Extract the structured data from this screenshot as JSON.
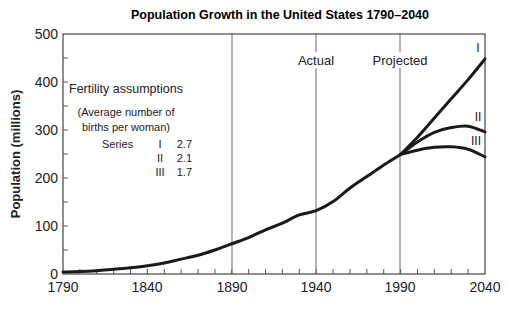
{
  "chart_data": {
    "type": "line",
    "title": "Population Growth in the United States 1790–2040",
    "xlabel": "",
    "ylabel": "Population (millions)",
    "xlim": [
      1790,
      2040
    ],
    "ylim": [
      0,
      500
    ],
    "x_ticks": [
      "1790",
      "1840",
      "1890",
      "1940",
      "1990",
      "2040"
    ],
    "y_ticks": [
      "0",
      "100",
      "200",
      "300",
      "400",
      "500"
    ],
    "grid": "vertical lines at 1890, 1940, 1990",
    "annotations": [
      "Actual",
      "Projected"
    ],
    "legend": {
      "title": "Fertility assumptions",
      "subtitle_line1": "(Average number of",
      "subtitle_line2": "births per woman)",
      "header": "Series",
      "rows": [
        {
          "series": "I",
          "value": "2.7"
        },
        {
          "series": "II",
          "value": "2.1"
        },
        {
          "series": "III",
          "value": "1.7"
        }
      ]
    },
    "series": [
      {
        "name": "Actual",
        "x": [
          1790,
          1800,
          1810,
          1820,
          1830,
          1840,
          1850,
          1860,
          1870,
          1880,
          1890,
          1900,
          1910,
          1920,
          1930,
          1940,
          1950,
          1960,
          1970,
          1980,
          1990
        ],
        "values": [
          4,
          5,
          7,
          10,
          13,
          17,
          23,
          31,
          39,
          50,
          63,
          76,
          92,
          106,
          123,
          132,
          151,
          179,
          203,
          227,
          249
        ]
      },
      {
        "name": "I",
        "x": [
          1990,
          2000,
          2010,
          2020,
          2030,
          2040
        ],
        "values": [
          249,
          285,
          325,
          365,
          405,
          448
        ]
      },
      {
        "name": "II",
        "x": [
          1990,
          2000,
          2010,
          2020,
          2030,
          2040
        ],
        "values": [
          249,
          275,
          295,
          305,
          308,
          296
        ]
      },
      {
        "name": "III",
        "x": [
          1990,
          2000,
          2010,
          2020,
          2030,
          2040
        ],
        "values": [
          249,
          258,
          264,
          265,
          260,
          244
        ]
      }
    ]
  }
}
